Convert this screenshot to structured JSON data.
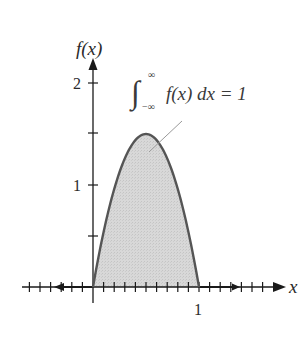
{
  "chart_data": {
    "type": "area",
    "title": "",
    "xlabel": "x",
    "ylabel": "f(x)",
    "function": "f(x) = 6x(1 - x) on [0, 1], 0 elsewhere",
    "x": [
      0,
      0.1,
      0.2,
      0.3,
      0.4,
      0.5,
      0.6,
      0.7,
      0.8,
      0.9,
      1.0
    ],
    "values": [
      0,
      0.54,
      0.96,
      1.26,
      1.44,
      1.5,
      1.44,
      1.26,
      0.96,
      0.54,
      0
    ],
    "xlim": [
      -0.7,
      1.7
    ],
    "ylim": [
      0,
      2.2
    ],
    "x_tick_labels": [
      {
        "value": 1,
        "label": "1"
      }
    ],
    "y_tick_labels": [
      {
        "value": 1,
        "label": "1"
      },
      {
        "value": 2,
        "label": "2"
      }
    ],
    "y_minor_ticks": [
      0.5,
      1.5
    ],
    "x_minor_tick_step": 0.1,
    "grid": false,
    "legend": null,
    "annotation": {
      "text": "∫_{-∞}^{∞} f(x) dx = 1",
      "integral_lower": "−∞",
      "integral_upper": "∞",
      "integrand": "f(x) dx = 1",
      "points_to": "shaded area under curve"
    },
    "colors": {
      "curve": "#555555",
      "fill": "#d6d6d6",
      "axis": "#1a1a1a",
      "pointer": "#999999"
    }
  },
  "labels": {
    "ylabel": "f(x)",
    "xlabel": "x",
    "y1": "1",
    "y2": "2",
    "x1": "1",
    "integral_sign": "∫",
    "integral_upper": "∞",
    "integral_lower": "−∞",
    "integrand": "f(x) dx = 1"
  }
}
